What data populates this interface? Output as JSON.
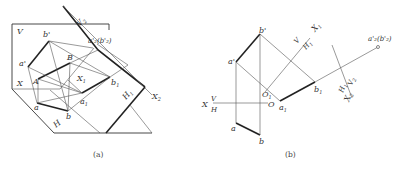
{
  "figure_a": {
    "caption": "(a)",
    "labels": {
      "V": "V",
      "b_prime": "b'",
      "B": "B",
      "a_prime": "a'",
      "A": "A",
      "X": "X",
      "X1": "X",
      "X1_sub": "1",
      "a": "a",
      "b": "b",
      "a1": "a",
      "a1_sub": "1",
      "b1": "b",
      "b1_sub": "1",
      "H": "H",
      "H1": "H",
      "H1_sub": "1",
      "X2": "X",
      "X2_sub": "2",
      "V2": "V",
      "V2_sub": "2",
      "a2b2": "a'₂(b'₂)"
    }
  },
  "figure_b": {
    "caption": "(b)",
    "labels": {
      "b_prime": "b'",
      "a_prime": "a'",
      "X": "X",
      "V": "V",
      "H": "H",
      "O": "O",
      "O1": "O",
      "O1_sub": "1",
      "a": "a",
      "b": "b",
      "a1": "a",
      "a1_sub": "1",
      "b1": "b",
      "b1_sub": "1",
      "V_top": "V",
      "H1_top": "H",
      "H1_top_sub": "1",
      "X1": "X",
      "X1_sub": "1",
      "a2b2": "a'₂(b'₂)",
      "H1": "H",
      "H1_sub": "1",
      "V2": "V",
      "V2_sub": "2",
      "X2": "X",
      "X2_sub": "2"
    }
  }
}
